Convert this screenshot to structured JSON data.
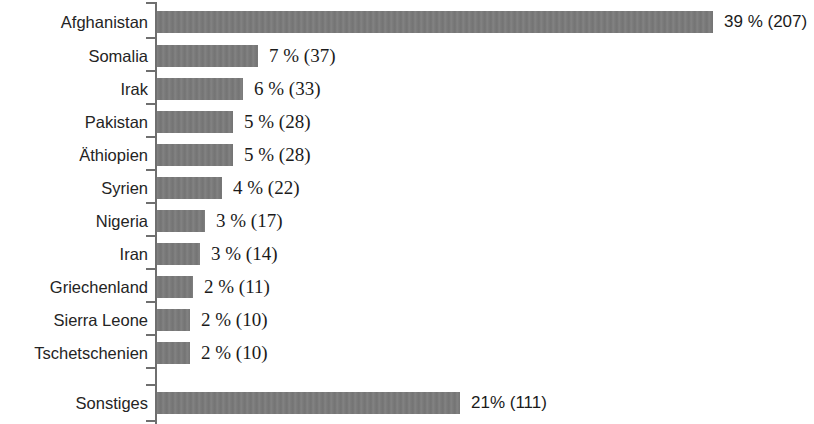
{
  "chart_data": {
    "type": "bar",
    "orientation": "horizontal",
    "title": "",
    "subtitle": "",
    "xlabel": "",
    "ylabel": "",
    "grid": false,
    "legend": null,
    "xlim": [
      0,
      39
    ],
    "axis": {
      "category_axis": "vertical-left",
      "ticks_visible": true,
      "value_axis_visible": false
    },
    "categories": [
      "Afghanistan",
      "Somalia",
      "Irak",
      "Pakistan",
      "Äthiopien",
      "Syrien",
      "Nigeria",
      "Iran",
      "Griechenland",
      "Sierra Leone",
      "Tschetschenien",
      "Sonstiges"
    ],
    "values": [
      39,
      7,
      6,
      5,
      5,
      4,
      3,
      3,
      2,
      2,
      2,
      21
    ],
    "counts": [
      207,
      37,
      33,
      28,
      28,
      22,
      17,
      14,
      11,
      10,
      10,
      111
    ],
    "data_labels": [
      "39 % (207)",
      "7 % (37)",
      "6 % (33)",
      "5 % (28)",
      "5 % (28)",
      "4 % (22)",
      "3 % (17)",
      "3 % (14)",
      "2 % (11)",
      "2 % (10)",
      "2 % (10)",
      "21% (111)"
    ],
    "colors": {
      "bar": "#7a7a7a",
      "axis": "#6f6f6f",
      "text": "#242424",
      "background": "#ffffff"
    }
  },
  "rows": [
    {
      "label": "Afghanistan",
      "value": 39,
      "count": 207,
      "data_label": "39 % (207)",
      "bar_px": 556,
      "top": 11,
      "label_style": "sans"
    },
    {
      "label": "Somalia",
      "value": 7,
      "count": 37,
      "data_label": "7 % (37)",
      "bar_px": 101,
      "top": 45,
      "label_style": "serif"
    },
    {
      "label": "Irak",
      "value": 6,
      "count": 33,
      "data_label": "6 % (33)",
      "bar_px": 86,
      "top": 78,
      "label_style": "serif"
    },
    {
      "label": "Pakistan",
      "value": 5,
      "count": 28,
      "data_label": "5 % (28)",
      "bar_px": 76,
      "top": 111,
      "label_style": "serif"
    },
    {
      "label": "Äthiopien",
      "value": 5,
      "count": 28,
      "data_label": "5 % (28)",
      "bar_px": 76,
      "top": 144,
      "label_style": "serif"
    },
    {
      "label": "Syrien",
      "value": 4,
      "count": 22,
      "data_label": "4 % (22)",
      "bar_px": 65,
      "top": 177,
      "label_style": "serif"
    },
    {
      "label": "Nigeria",
      "value": 3,
      "count": 17,
      "data_label": "3 % (17)",
      "bar_px": 48,
      "top": 210,
      "label_style": "serif"
    },
    {
      "label": "Iran",
      "value": 3,
      "count": 14,
      "data_label": "3 % (14)",
      "bar_px": 43,
      "top": 243,
      "label_style": "serif"
    },
    {
      "label": "Griechenland",
      "value": 2,
      "count": 11,
      "data_label": "2 % (11)",
      "bar_px": 36,
      "top": 276,
      "label_style": "serif"
    },
    {
      "label": "Sierra Leone",
      "value": 2,
      "count": 10,
      "data_label": "2 % (10)",
      "bar_px": 33,
      "top": 309,
      "label_style": "serif"
    },
    {
      "label": "Tschetschenien",
      "value": 2,
      "count": 10,
      "data_label": "2 % (10)",
      "bar_px": 33,
      "top": 342,
      "label_style": "serif"
    },
    {
      "label": "Sonstiges",
      "value": 21,
      "count": 111,
      "data_label": "21% (111)",
      "bar_px": 303,
      "top": 392,
      "label_style": "sans"
    }
  ],
  "ticks": [
    2,
    37,
    70,
    103,
    136,
    169,
    202,
    235,
    268,
    301,
    334,
    367,
    384,
    420
  ]
}
